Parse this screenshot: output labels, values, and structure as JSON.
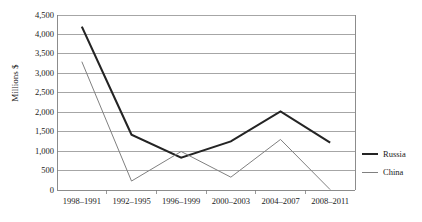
{
  "chart_data": {
    "type": "line",
    "title": "",
    "xlabel": "",
    "ylabel": "Millions $",
    "categories": [
      "1998–1991",
      "1992–1995",
      "1996–1999",
      "2000–2003",
      "2004–2007",
      "2008–2011"
    ],
    "series": [
      {
        "name": "Russia",
        "color": "#242424",
        "width": 2.1,
        "values": [
          4200,
          1420,
          830,
          1250,
          2020,
          1220
        ]
      },
      {
        "name": "China",
        "color": "#808080",
        "width": 1.0,
        "values": [
          3300,
          230,
          990,
          330,
          1300,
          10
        ]
      }
    ],
    "ylim": [
      0,
      4500
    ],
    "yticks": [
      0,
      500,
      1000,
      1500,
      2000,
      2500,
      3000,
      3500,
      4000,
      4500
    ],
    "ytick_labels": [
      "0",
      "500",
      "1,000",
      "1,500",
      "2,000",
      "2,500",
      "3,000",
      "3,500",
      "4,000",
      "4,500"
    ],
    "grid": true,
    "grid_color": "#808080",
    "axis_color": "#808080",
    "legend_position": "right"
  },
  "legend": {
    "entries": [
      {
        "label": "Russia"
      },
      {
        "label": "China"
      }
    ]
  }
}
